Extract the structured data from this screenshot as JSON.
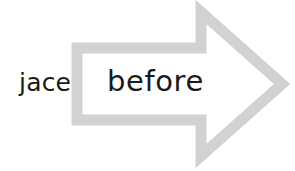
{
  "canvas": {
    "width": 295,
    "height": 171,
    "background_color": "#ffffff"
  },
  "labels": {
    "outside_text": "jace",
    "inside_text": "before",
    "text_color": "#1a1a1a"
  },
  "arrow": {
    "icon_name": "right-arrow-outline",
    "style": "hollow outline",
    "direction": "right",
    "stroke_color": "#d2d2d2",
    "stroke_width": 11,
    "fill": "none",
    "outer_path": "M 77 48 L 201 48 L 201 12 L 282 84 L 201 156 L 201 120 L 77 120 Z",
    "vertices": {
      "shaft_top_left": [
        77,
        48
      ],
      "shaft_top_right": [
        201,
        48
      ],
      "barb_top": [
        201,
        12
      ],
      "tip": [
        282,
        84
      ],
      "barb_bottom": [
        201,
        156
      ],
      "shaft_bottom_right": [
        201,
        120
      ],
      "shaft_bottom_left": [
        77,
        120
      ]
    }
  }
}
